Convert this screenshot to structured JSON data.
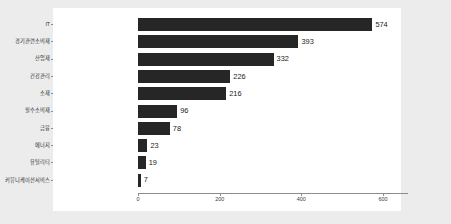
{
  "chart_data": {
    "type": "bar",
    "orientation": "horizontal",
    "title": "",
    "subtitle": "",
    "xlabel": "",
    "ylabel": "",
    "categories": [
      "IT",
      "경기관련소비재",
      "산업재",
      "건강관리",
      "소재",
      "필수소비재",
      "금융",
      "에너지",
      "유틸리티",
      "커뮤니케이션서비스"
    ],
    "values": [
      574,
      393,
      332,
      226,
      216,
      96,
      78,
      23,
      19,
      7
    ],
    "data_labels": [
      "574",
      "393",
      "332",
      "226",
      "216",
      "96",
      "78",
      "23",
      "19",
      "7"
    ],
    "xticks": [
      0,
      200,
      400,
      600
    ],
    "xtick_labels": [
      "0",
      "200",
      "400",
      "600"
    ],
    "xlim": [
      0,
      660
    ],
    "grid": false,
    "legend": false,
    "bar_color": "#262626",
    "panel_background": "#ffffff",
    "figure_background": "#ececed",
    "axis_color": "#8c8c8c",
    "label_color": "#2b2b2b"
  }
}
